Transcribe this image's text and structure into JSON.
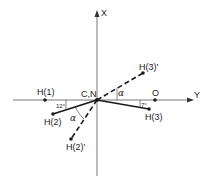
{
  "diagram": {
    "type": "molecular-geometry",
    "axes": {
      "x_label": "X",
      "y_label": "Y",
      "origin_label": "C,N"
    },
    "atoms": [
      {
        "id": "H1",
        "label": "H(1)"
      },
      {
        "id": "H2",
        "label": "H(2)"
      },
      {
        "id": "H3",
        "label": "H(3)"
      },
      {
        "id": "H2p",
        "label": "H(2)'"
      },
      {
        "id": "H3p",
        "label": "H(3)'"
      },
      {
        "id": "O",
        "label": "O"
      }
    ],
    "angles": {
      "h2_angle": "12°",
      "h3_angle": "7°",
      "alpha_upper": "α",
      "alpha_lower": "α"
    },
    "colors": {
      "line": "#1a1a1a",
      "axis": "#555555",
      "background": "#ffffff"
    }
  }
}
